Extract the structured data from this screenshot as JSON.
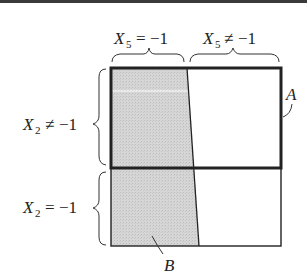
{
  "diagram": {
    "top_labels": [
      {
        "var": "X",
        "sub": "5",
        "rel": "=",
        "val": "−1"
      },
      {
        "var": "X",
        "sub": "5",
        "rel": "≠",
        "val": "−1"
      }
    ],
    "left_labels": [
      {
        "var": "X",
        "sub": "2",
        "rel": "≠",
        "val": "−1"
      },
      {
        "var": "X",
        "sub": "2",
        "rel": "=",
        "val": "−1"
      }
    ],
    "region_labels": {
      "A": "A",
      "B": "B"
    },
    "colors": {
      "shade": "#d2d2d2",
      "stroke": "#222222",
      "background": "#ffffff"
    }
  }
}
